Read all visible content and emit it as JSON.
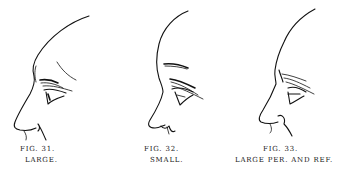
{
  "figures": [
    {
      "id": "fig31",
      "number": "FIG. 31.",
      "label": "LARGE."
    },
    {
      "id": "fig32",
      "number": "FIG. 32.",
      "label": "SMALL."
    },
    {
      "id": "fig33",
      "number": "FIG. 33.",
      "label": "LARGE PER. AND REF."
    }
  ]
}
